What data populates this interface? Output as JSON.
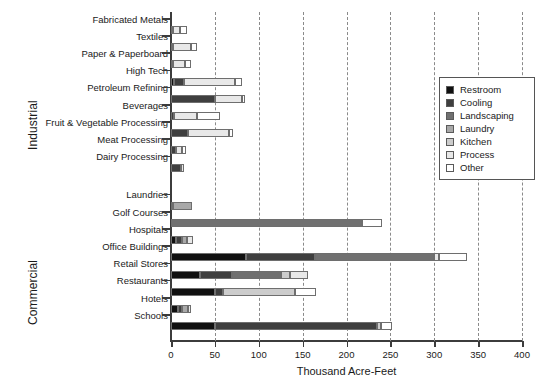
{
  "chart_data": {
    "type": "bar",
    "orientation": "horizontal",
    "stacked": true,
    "title": "",
    "xlabel": "Thousand Acre-Feet",
    "ylabel": "",
    "xlim": [
      0,
      400
    ],
    "xticks": [
      0,
      50,
      100,
      150,
      200,
      250,
      300,
      350,
      400
    ],
    "grid": "vertical-dashed",
    "legend_position": "upper-right-inside",
    "series": [
      {
        "name": "Restroom",
        "color": "#101010"
      },
      {
        "name": "Cooling",
        "color": "#3f3f3f"
      },
      {
        "name": "Landscaping",
        "color": "#707070"
      },
      {
        "name": "Laundry",
        "color": "#a8a8a8"
      },
      {
        "name": "Kitchen",
        "color": "#cccccc"
      },
      {
        "name": "Process",
        "color": "#e8e8e8"
      },
      {
        "name": "Other",
        "color": "#ffffff"
      }
    ],
    "groups": [
      {
        "name": "Industrial",
        "categories": [
          "Fabricated Metals",
          "Textiles",
          "Paper & Paperboard",
          "High Tech",
          "Petroleum Refining",
          "Beverages",
          "Fruit & Vegetable Processing",
          "Meat Processing",
          "Dairy Processing"
        ],
        "values": [
          [
            0,
            2,
            0,
            0,
            0,
            8,
            8
          ],
          [
            0,
            2,
            0,
            0,
            0,
            21,
            6
          ],
          [
            0,
            2,
            0,
            0,
            0,
            14,
            6
          ],
          [
            3,
            12,
            0,
            0,
            0,
            58,
            8
          ],
          [
            0,
            50,
            0,
            0,
            0,
            31,
            3
          ],
          [
            0,
            3,
            0,
            0,
            0,
            27,
            26
          ],
          [
            0,
            19,
            0,
            0,
            0,
            47,
            5
          ],
          [
            0,
            6,
            0,
            0,
            0,
            7,
            4
          ],
          [
            0,
            11,
            0,
            0,
            0,
            4,
            0
          ]
        ]
      },
      {
        "name": "Commercial",
        "categories": [
          "Laundries",
          "Golf Courses",
          "Hospitals",
          "Office Buildings",
          "Retail Stores",
          "Restaurants",
          "Hotels",
          "Schools"
        ],
        "values": [
          [
            2,
            0,
            0,
            22,
            0,
            0,
            0
          ],
          [
            0,
            0,
            218,
            0,
            0,
            0,
            22
          ],
          [
            6,
            7,
            0,
            5,
            0,
            7,
            0
          ],
          [
            86,
            78,
            136,
            0,
            0,
            5,
            32
          ],
          [
            33,
            37,
            55,
            0,
            11,
            20,
            0
          ],
          [
            50,
            9,
            0,
            0,
            82,
            0,
            24
          ],
          [
            8,
            5,
            0,
            6,
            0,
            4,
            0
          ],
          [
            50,
            185,
            0,
            0,
            4,
            0,
            13
          ]
        ]
      }
    ]
  },
  "legend": {
    "items": [
      {
        "label": "Restroom",
        "color": "#101010"
      },
      {
        "label": "Cooling",
        "color": "#3f3f3f"
      },
      {
        "label": "Landscaping",
        "color": "#707070"
      },
      {
        "label": "Laundry",
        "color": "#a8a8a8"
      },
      {
        "label": "Kitchen",
        "color": "#cccccc"
      },
      {
        "label": "Process",
        "color": "#e8e8e8"
      },
      {
        "label": "Other",
        "color": "#ffffff"
      }
    ]
  },
  "axis": {
    "x_title": "Thousand Acre-Feet",
    "x_tick_labels": [
      "0",
      "50",
      "100",
      "150",
      "200",
      "250",
      "300",
      "350",
      "400"
    ],
    "group_labels": [
      "Industrial",
      "Commercial"
    ]
  }
}
